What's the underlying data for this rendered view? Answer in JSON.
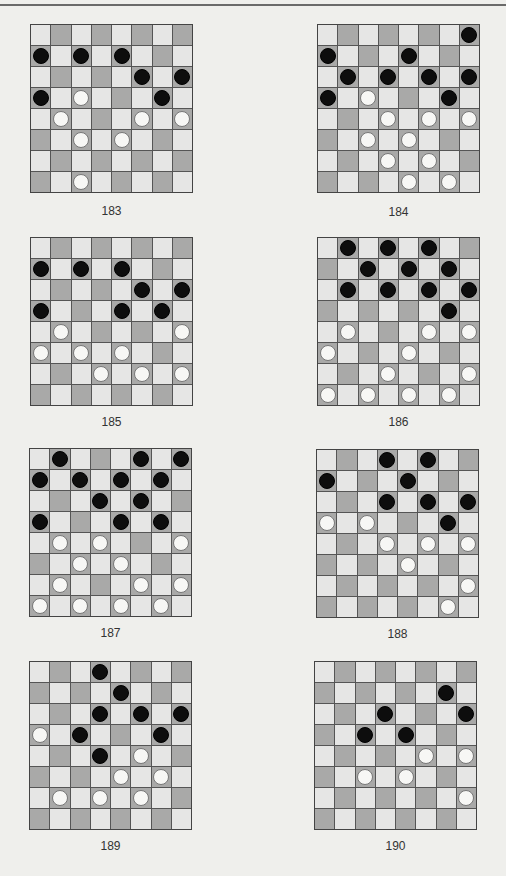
{
  "page": {
    "colors": {
      "background": "#efefec",
      "light_square": "#e6e6e5",
      "dark_square": "#a9a9a8",
      "black_piece": "#0d0d0d",
      "white_piece": "#f7f7f5",
      "grid_line": "#555555"
    },
    "board_size": 8
  },
  "puzzles": [
    {
      "number": "183",
      "black": [
        [
          1,
          0
        ],
        [
          1,
          2
        ],
        [
          1,
          4
        ],
        [
          2,
          5
        ],
        [
          2,
          7
        ],
        [
          3,
          0
        ],
        [
          3,
          6
        ]
      ],
      "white": [
        [
          3,
          2
        ],
        [
          4,
          1
        ],
        [
          4,
          5
        ],
        [
          4,
          7
        ],
        [
          5,
          2
        ],
        [
          5,
          4
        ],
        [
          7,
          2
        ]
      ]
    },
    {
      "number": "184",
      "black": [
        [
          0,
          7
        ],
        [
          1,
          0
        ],
        [
          1,
          4
        ],
        [
          2,
          1
        ],
        [
          2,
          3
        ],
        [
          2,
          5
        ],
        [
          2,
          7
        ],
        [
          3,
          0
        ],
        [
          3,
          6
        ]
      ],
      "white": [
        [
          3,
          2
        ],
        [
          4,
          3
        ],
        [
          4,
          5
        ],
        [
          4,
          7
        ],
        [
          5,
          2
        ],
        [
          5,
          4
        ],
        [
          6,
          3
        ],
        [
          6,
          5
        ],
        [
          7,
          4
        ],
        [
          7,
          6
        ]
      ]
    },
    {
      "number": "185",
      "black": [
        [
          1,
          0
        ],
        [
          1,
          2
        ],
        [
          1,
          4
        ],
        [
          2,
          5
        ],
        [
          2,
          7
        ],
        [
          3,
          0
        ],
        [
          3,
          4
        ],
        [
          3,
          6
        ]
      ],
      "white": [
        [
          4,
          1
        ],
        [
          4,
          7
        ],
        [
          5,
          0
        ],
        [
          5,
          2
        ],
        [
          5,
          4
        ],
        [
          6,
          3
        ],
        [
          6,
          5
        ],
        [
          6,
          7
        ]
      ]
    },
    {
      "number": "186",
      "black": [
        [
          0,
          1
        ],
        [
          0,
          3
        ],
        [
          0,
          5
        ],
        [
          1,
          2
        ],
        [
          1,
          4
        ],
        [
          1,
          6
        ],
        [
          2,
          1
        ],
        [
          2,
          3
        ],
        [
          2,
          5
        ],
        [
          2,
          7
        ],
        [
          3,
          6
        ]
      ],
      "white": [
        [
          4,
          1
        ],
        [
          4,
          5
        ],
        [
          4,
          7
        ],
        [
          5,
          0
        ],
        [
          5,
          4
        ],
        [
          6,
          3
        ],
        [
          6,
          7
        ],
        [
          7,
          0
        ],
        [
          7,
          2
        ],
        [
          7,
          4
        ],
        [
          7,
          6
        ]
      ]
    },
    {
      "number": "187",
      "black": [
        [
          0,
          1
        ],
        [
          0,
          5
        ],
        [
          0,
          7
        ],
        [
          1,
          0
        ],
        [
          1,
          2
        ],
        [
          1,
          4
        ],
        [
          1,
          6
        ],
        [
          2,
          3
        ],
        [
          2,
          5
        ],
        [
          3,
          0
        ],
        [
          3,
          4
        ],
        [
          3,
          6
        ]
      ],
      "white": [
        [
          4,
          1
        ],
        [
          4,
          3
        ],
        [
          4,
          7
        ],
        [
          5,
          2
        ],
        [
          5,
          4
        ],
        [
          6,
          1
        ],
        [
          6,
          5
        ],
        [
          6,
          7
        ],
        [
          7,
          0
        ],
        [
          7,
          2
        ],
        [
          7,
          4
        ],
        [
          7,
          6
        ]
      ]
    },
    {
      "number": "188",
      "black": [
        [
          0,
          3
        ],
        [
          0,
          5
        ],
        [
          1,
          0
        ],
        [
          1,
          4
        ],
        [
          2,
          3
        ],
        [
          2,
          5
        ],
        [
          2,
          7
        ],
        [
          3,
          6
        ]
      ],
      "white": [
        [
          3,
          0
        ],
        [
          3,
          2
        ],
        [
          4,
          3
        ],
        [
          4,
          5
        ],
        [
          4,
          7
        ],
        [
          5,
          4
        ],
        [
          6,
          7
        ],
        [
          7,
          6
        ]
      ]
    },
    {
      "number": "189",
      "black": [
        [
          0,
          3
        ],
        [
          1,
          4
        ],
        [
          2,
          3
        ],
        [
          2,
          5
        ],
        [
          2,
          7
        ],
        [
          3,
          2
        ],
        [
          3,
          6
        ],
        [
          4,
          3
        ]
      ],
      "white": [
        [
          3,
          0
        ],
        [
          4,
          5
        ],
        [
          5,
          4
        ],
        [
          5,
          6
        ],
        [
          6,
          1
        ],
        [
          6,
          3
        ],
        [
          6,
          5
        ]
      ]
    },
    {
      "number": "190",
      "black": [
        [
          1,
          6
        ],
        [
          2,
          3
        ],
        [
          2,
          7
        ],
        [
          3,
          2
        ],
        [
          3,
          4
        ]
      ],
      "white": [
        [
          4,
          5
        ],
        [
          4,
          7
        ],
        [
          5,
          2
        ],
        [
          5,
          4
        ],
        [
          6,
          7
        ]
      ]
    }
  ]
}
